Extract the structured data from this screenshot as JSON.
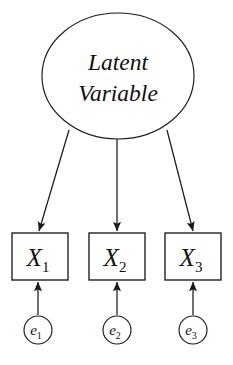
{
  "diagram": {
    "type": "path-diagram",
    "colors": {
      "background": "#ffffff",
      "stroke": "#1a1a1a",
      "text": "#111111",
      "node_fill": "#ffffff"
    }
  },
  "latent": {
    "shape": "ellipse",
    "line1": "Latent",
    "line2": "Variable",
    "center_x": 118,
    "center_y": 76,
    "radius_x": 76,
    "radius_y": 63
  },
  "indicators": [
    {
      "id": "x1",
      "shape": "rectangle",
      "label": "X",
      "subscript": "1",
      "x": 12,
      "y": 233,
      "width": 56,
      "height": 47
    },
    {
      "id": "x2",
      "shape": "rectangle",
      "label": "X",
      "subscript": "2",
      "x": 89,
      "y": 233,
      "width": 56,
      "height": 47
    },
    {
      "id": "x3",
      "shape": "rectangle",
      "label": "X",
      "subscript": "3",
      "x": 165,
      "y": 233,
      "width": 56,
      "height": 47
    }
  ],
  "errors": [
    {
      "id": "e1",
      "shape": "circle",
      "label": "e",
      "subscript": "1",
      "center_x": 38,
      "center_y": 330,
      "radius": 14
    },
    {
      "id": "e2",
      "shape": "circle",
      "label": "e",
      "subscript": "2",
      "center_x": 117,
      "center_y": 330,
      "radius": 14
    },
    {
      "id": "e3",
      "shape": "circle",
      "label": "e",
      "subscript": "3",
      "center_x": 193,
      "center_y": 330,
      "radius": 14
    }
  ],
  "loading_paths": [
    {
      "id": "loading-1",
      "from": "latent",
      "to": "x1",
      "x1": 69,
      "y1": 130,
      "x2": 39,
      "y2": 231
    },
    {
      "id": "loading-2",
      "from": "latent",
      "to": "x2",
      "x1": 117,
      "y1": 139,
      "x2": 117,
      "y2": 231
    },
    {
      "id": "loading-3",
      "from": "latent",
      "to": "x3",
      "x1": 167,
      "y1": 130,
      "x2": 193,
      "y2": 231
    }
  ],
  "error_paths": [
    {
      "id": "error-path-1",
      "from": "e1",
      "to": "x1",
      "x1": 38,
      "y1": 315,
      "x2": 38,
      "y2": 282
    },
    {
      "id": "error-path-2",
      "from": "e2",
      "to": "x2",
      "x1": 117,
      "y1": 315,
      "x2": 117,
      "y2": 282
    },
    {
      "id": "error-path-3",
      "from": "e3",
      "to": "x3",
      "x1": 193,
      "y1": 315,
      "x2": 193,
      "y2": 282
    }
  ]
}
